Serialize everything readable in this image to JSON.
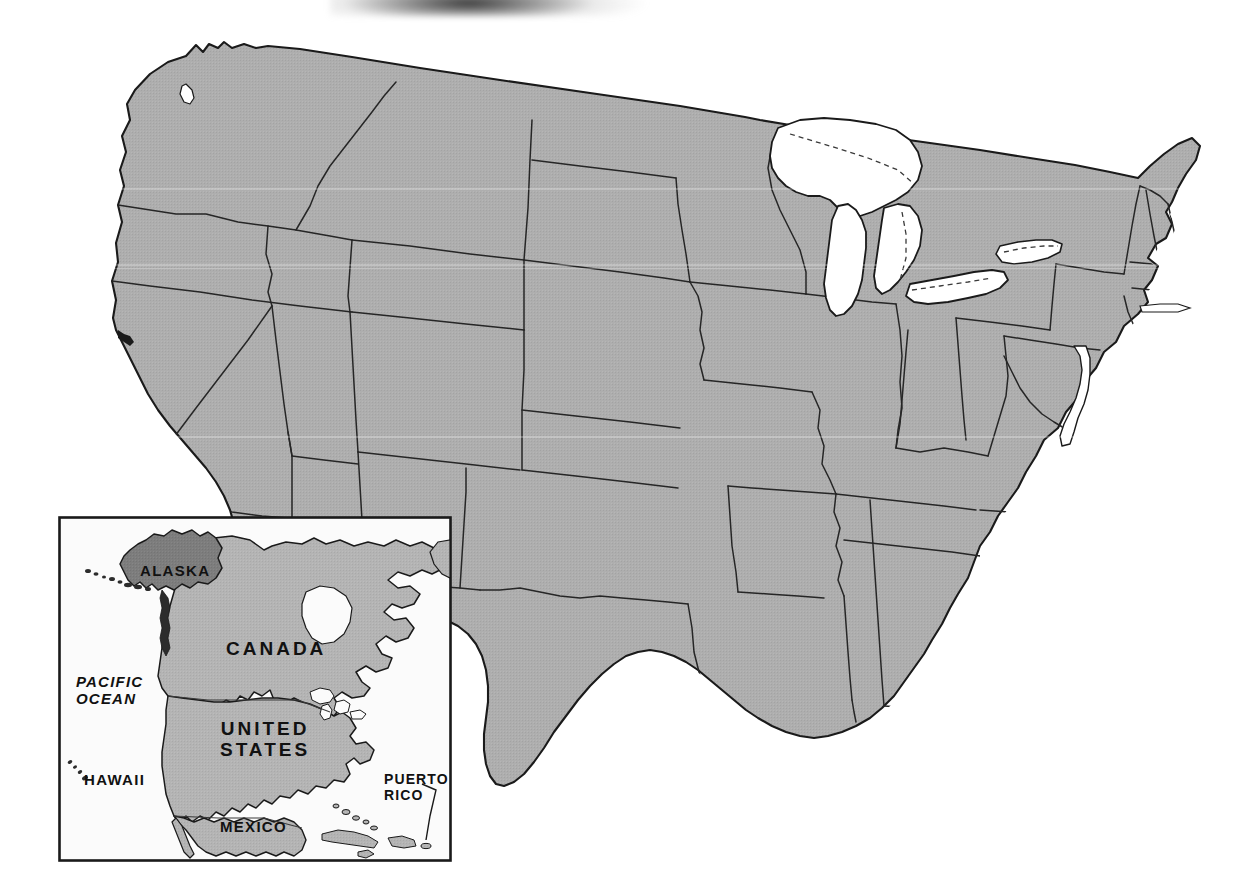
{
  "document": {
    "kind": "reference-map",
    "title": "United States",
    "projection_note": "contiguous United States with state boundaries"
  },
  "canvas": {
    "width": 1254,
    "height": 890,
    "background": "#ffffff"
  },
  "colors": {
    "land_fill": "#aeaeae",
    "land_fill_inset": "#b4b4b4",
    "highlight_fill": "#7d7d7d",
    "water_fill": "#ffffff",
    "outline": "#1a1a1a",
    "state_border": "#262626",
    "inset_frame": "#1a1a1a",
    "label_text": "#111111",
    "scan_shadow": "#2c2c2c"
  },
  "main_map": {
    "name": "contiguous-united-states",
    "fill": "#aeaeae",
    "outline": "#1a1a1a",
    "features": {
      "great_lakes": "white water bodies with dashed international boundary",
      "chesapeake_bay": "white inlet",
      "state_borders": "thin black lines"
    }
  },
  "inset": {
    "name": "north-america-locator",
    "frame": {
      "x": 58,
      "y": 516,
      "width": 394,
      "height": 346
    },
    "labels": [
      {
        "id": "alaska",
        "text": "ALASKA",
        "style": "region",
        "x": 82,
        "y": 47,
        "align": "left"
      },
      {
        "id": "canada",
        "text": "CANADA",
        "style": "country",
        "x": 168,
        "y": 122,
        "align": "left"
      },
      {
        "id": "pacific-ocean",
        "text": "PACIFIC\nOCEAN",
        "style": "ocean",
        "x": 18,
        "y": 158,
        "align": "left"
      },
      {
        "id": "united-states",
        "text": "UNITED\nSTATES",
        "style": "country",
        "x": 162,
        "y": 202,
        "align": "left"
      },
      {
        "id": "hawaii",
        "text": "HAWAII",
        "style": "region",
        "x": 26,
        "y": 256,
        "align": "left"
      },
      {
        "id": "puerto-rico",
        "text": "PUERTO\nRICO",
        "style": "small",
        "x": 326,
        "y": 256,
        "align": "left"
      },
      {
        "id": "mexico",
        "text": "MEXICO",
        "style": "region",
        "x": 162,
        "y": 303,
        "align": "left"
      }
    ],
    "highlighted_region": "ALASKA",
    "leader_lines": [
      "puerto-rico"
    ]
  },
  "artifacts": {
    "top_edge_shadow": "dark scan shadow along upper edge near x=330-660"
  }
}
